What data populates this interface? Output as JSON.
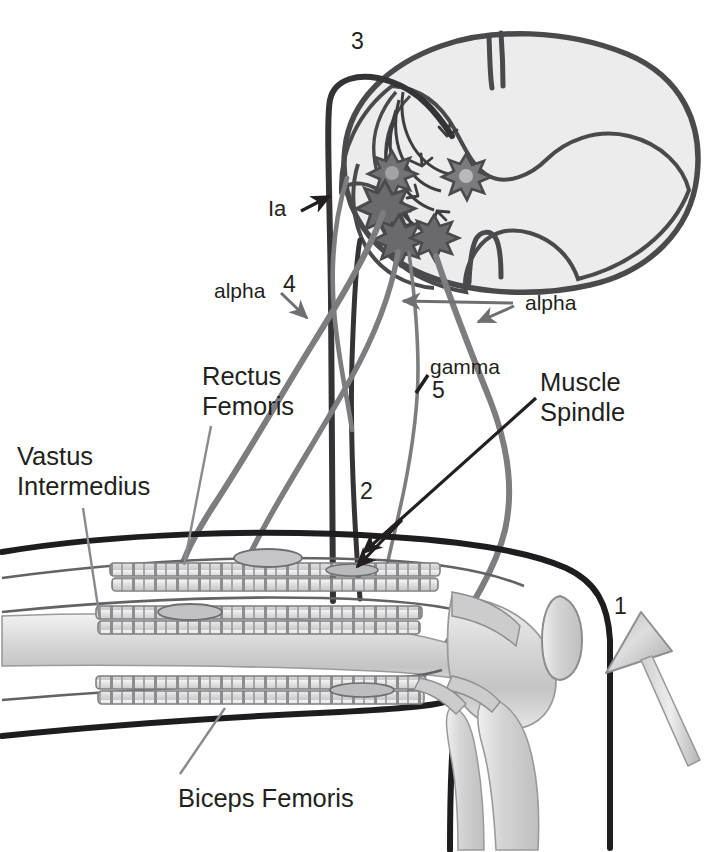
{
  "figure": {
    "background_color": "#ffffff",
    "ink_color": "#231f20",
    "nerve_dark_color": "#3a3a3c",
    "nerve_gray_color": "#7b7b7e",
    "neuron_fill_color": "#6e6e70",
    "gray_matter_fill": "#ececec",
    "bone_fill": "#d8d8d8",
    "leader_color": "#7e7e81"
  },
  "labels": {
    "marker_1": "1",
    "marker_2": "2",
    "marker_3": "3",
    "marker_4": "4",
    "marker_5": "5",
    "ia": "Ia",
    "alpha_left": "alpha",
    "alpha_right": "alpha",
    "gamma": "gamma",
    "rectus_femoris_line1": "Rectus",
    "rectus_femoris_line2": "Femoris",
    "vastus_intermedius_line1": "Vastus",
    "vastus_intermedius_line2": "Intermedius",
    "muscle_spindle_line1": "Muscle",
    "muscle_spindle_line2": "Spindle",
    "biceps_femoris": "Biceps Femoris"
  },
  "structures": {
    "spinal_cord": "spinal-cord-cross-section",
    "gray_matter": "butterfly-gray-matter",
    "motor_neurons_count": 4,
    "interneuron_count": 1,
    "muscle_bellies": [
      "rectus-femoris",
      "vastus-intermedius",
      "biceps-femoris"
    ],
    "muscle_spindles_count": 4,
    "bones": [
      "femur",
      "patella",
      "tibia",
      "fibula"
    ],
    "instrument": "reflex-hammer"
  },
  "legend_numbers": {
    "1": "reflex hammer tap on patellar tendon",
    "2": "muscle spindle stretch",
    "3": "dorsal root afferent entry",
    "4": "alpha motor neuron axon to agonist",
    "5": "gamma motor neuron axon to spindle"
  }
}
